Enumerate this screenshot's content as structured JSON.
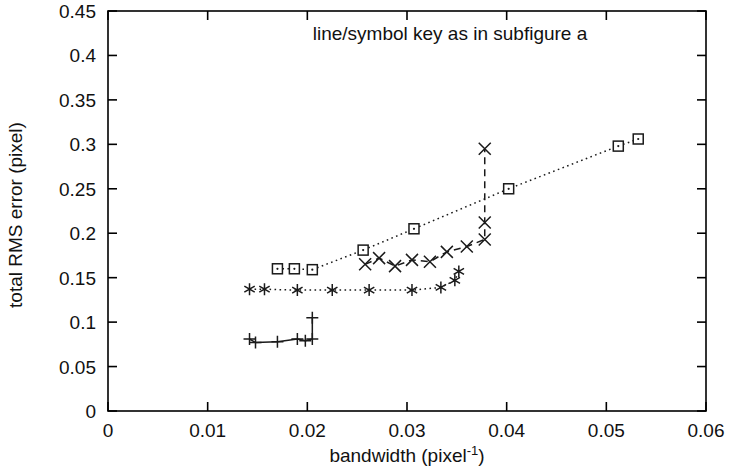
{
  "figure": {
    "annotation": "line/symbol key as in subfigure a",
    "background_color": "#ffffff",
    "ink_color": "#1a1a1a"
  },
  "chart_data": {
    "type": "line",
    "title": "",
    "subtitle": "",
    "xlabel": "bandwidth (pixel",
    "xlabel_superscript": "-1",
    "xlabel_suffix": ")",
    "ylabel": "total RMS error (pixel)",
    "xlim": [
      0,
      0.06
    ],
    "ylim": [
      0,
      0.45
    ],
    "xticks": [
      0,
      0.01,
      0.02,
      0.03,
      0.04,
      0.05,
      0.06
    ],
    "xtick_labels": [
      "0",
      "0.01",
      "0.02",
      "0.03",
      "0.04",
      "0.05",
      "0.06"
    ],
    "yticks": [
      0,
      0.05,
      0.1,
      0.15,
      0.2,
      0.25,
      0.3,
      0.35,
      0.4,
      0.45
    ],
    "ytick_labels": [
      "0",
      "0.05",
      "0.1",
      "0.15",
      "0.2",
      "0.25",
      "0.3",
      "0.35",
      "0.4",
      "0.45"
    ],
    "grid": false,
    "legend": "none",
    "annotations": [
      {
        "text": "line/symbol key as in subfigure a",
        "x": 0.0345,
        "y": 0.415,
        "align": "start"
      }
    ],
    "series": [
      {
        "name": "square-dotted",
        "marker": "square",
        "linestyle": "dotted",
        "x": [
          0.017,
          0.0187,
          0.0205,
          0.0256,
          0.0307,
          0.0402,
          0.0512,
          0.0532
        ],
        "y": [
          0.16,
          0.16,
          0.159,
          0.181,
          0.205,
          0.25,
          0.298,
          0.306
        ]
      },
      {
        "name": "cross-dashed",
        "marker": "x",
        "linestyle": "dashed",
        "x": [
          0.0258,
          0.0272,
          0.0288,
          0.0305,
          0.0323,
          0.034,
          0.036,
          0.0378,
          0.0378,
          0.0378
        ],
        "y": [
          0.165,
          0.172,
          0.163,
          0.17,
          0.168,
          0.179,
          0.185,
          0.193,
          0.212,
          0.295
        ]
      },
      {
        "name": "asterisk-dotted",
        "marker": "asterisk",
        "linestyle": "dotted",
        "x": [
          0.0142,
          0.0157,
          0.019,
          0.0225,
          0.0262,
          0.0305,
          0.0334,
          0.0348,
          0.0352
        ],
        "y": [
          0.137,
          0.137,
          0.136,
          0.136,
          0.136,
          0.136,
          0.139,
          0.147,
          0.157
        ]
      },
      {
        "name": "plus-solid",
        "marker": "plus",
        "linestyle": "solid",
        "x": [
          0.0142,
          0.0148,
          0.017,
          0.019,
          0.0198,
          0.0205,
          0.0205
        ],
        "y": [
          0.081,
          0.077,
          0.078,
          0.081,
          0.079,
          0.081,
          0.105
        ]
      }
    ]
  }
}
